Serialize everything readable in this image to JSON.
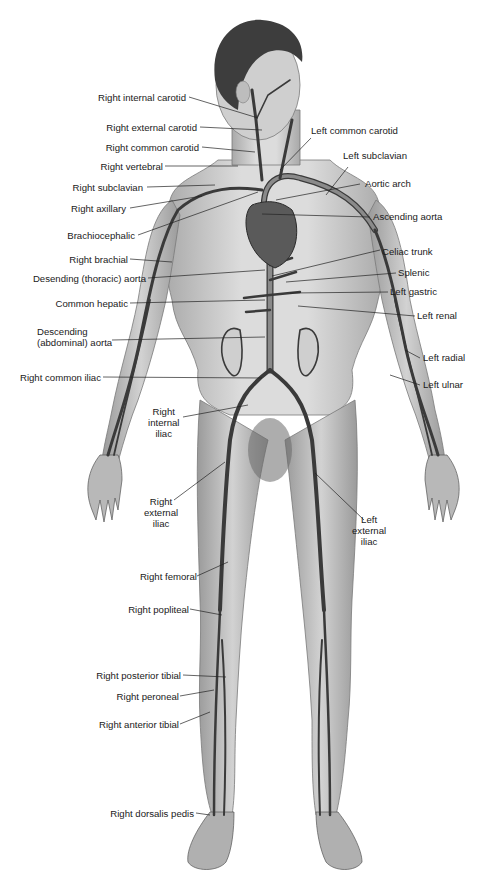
{
  "diagram": {
    "colors": {
      "skin": "#c9c9c9",
      "skin_dark": "#8a8a8a",
      "hair": "#3a3a3a",
      "artery": "#6f6f6f",
      "artery_edge": "#2e2e2e",
      "heart": "#5a5a5a",
      "leader": "#222222",
      "text": "#1a1a1a"
    },
    "labels_left": [
      {
        "id": "right-internal-carotid",
        "text": "Right internal carotid"
      },
      {
        "id": "right-external-carotid",
        "text": "Right external carotid"
      },
      {
        "id": "right-common-carotid",
        "text": "Right common carotid"
      },
      {
        "id": "right-vertebral",
        "text": "Right vertebral"
      },
      {
        "id": "right-subclavian",
        "text": "Right subclavian"
      },
      {
        "id": "right-axillary",
        "text": "Right axillary"
      },
      {
        "id": "brachiocephalic",
        "text": "Brachiocephalic"
      },
      {
        "id": "right-brachial",
        "text": "Right brachial"
      },
      {
        "id": "descending-thoracic-aorta",
        "text": "Desending (thoracic) aorta"
      },
      {
        "id": "common-hepatic",
        "text": "Common hepatic"
      },
      {
        "id": "descending-abdominal-aorta",
        "text": "Descending\n(abdominal) aorta"
      },
      {
        "id": "right-common-iliac",
        "text": "Right common iliac"
      },
      {
        "id": "right-internal-iliac",
        "text": "Right\ninternal\niliac"
      },
      {
        "id": "right-external-iliac",
        "text": "Right\nexternal\niliac"
      },
      {
        "id": "right-femoral",
        "text": "Right femoral"
      },
      {
        "id": "right-popliteal",
        "text": "Right popliteal"
      },
      {
        "id": "right-posterior-tibial",
        "text": "Right posterior tibial"
      },
      {
        "id": "right-peroneal",
        "text": "Right peroneal"
      },
      {
        "id": "right-anterior-tibial",
        "text": "Right anterior tibial"
      },
      {
        "id": "right-dorsalis-pedis",
        "text": "Right dorsalis pedis"
      }
    ],
    "labels_right": [
      {
        "id": "left-common-carotid",
        "text": "Left common carotid"
      },
      {
        "id": "left-subclavian",
        "text": "Left subclavian"
      },
      {
        "id": "aortic-arch",
        "text": "Aortic arch"
      },
      {
        "id": "ascending-aorta",
        "text": "Ascending aorta"
      },
      {
        "id": "celiac-trunk",
        "text": "Celiac trunk"
      },
      {
        "id": "splenic",
        "text": "Splenic"
      },
      {
        "id": "left-gastric",
        "text": "Left gastric"
      },
      {
        "id": "left-renal",
        "text": "Left renal"
      },
      {
        "id": "left-radial",
        "text": "Left radial"
      },
      {
        "id": "left-ulnar",
        "text": "Left ulnar"
      },
      {
        "id": "left-external-iliac",
        "text": "Left\nexternal\niliac"
      }
    ]
  }
}
